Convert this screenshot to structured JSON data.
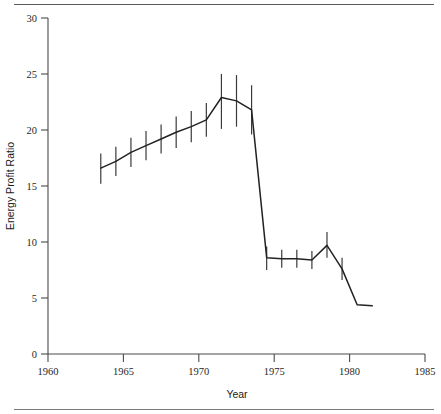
{
  "figure": {
    "has_top_rule": true,
    "has_bottom_rule": true,
    "background_color": "#ffffff",
    "line_color": "#222222",
    "axis_color": "#4a4a4a",
    "errorbar_color": "#3a3a3a"
  },
  "chart_data": {
    "type": "line",
    "title": "",
    "subtitle": "",
    "xlabel": "Year",
    "ylabel": "Energy Profit Ratio",
    "xlim": [
      1960,
      1985
    ],
    "ylim": [
      0,
      30
    ],
    "xticks": [
      1960,
      1965,
      1970,
      1975,
      1980,
      1985
    ],
    "xtick_labels": [
      "1960",
      "1965",
      "1970",
      "1975",
      "1980",
      "1985"
    ],
    "yticks": [
      0,
      5,
      10,
      15,
      20,
      25,
      30
    ],
    "ytick_labels": [
      "0",
      "5",
      "10",
      "15",
      "20",
      "25",
      "30"
    ],
    "grid": false,
    "legend": null,
    "legend_position": "none",
    "annotations": [],
    "series": [
      {
        "name": "Energy Profit Ratio",
        "x": [
          1963.5,
          1964.5,
          1965.5,
          1966.5,
          1967.5,
          1968.5,
          1969.5,
          1970.5,
          1971.5,
          1972.5,
          1973.5,
          1974.5,
          1975.5,
          1976.5,
          1977.5,
          1978.5,
          1979.5,
          1980.5,
          1981.5
        ],
        "values": [
          16.6,
          17.2,
          18.0,
          18.6,
          19.2,
          19.8,
          20.3,
          20.9,
          22.9,
          22.6,
          21.8,
          8.6,
          8.5,
          8.5,
          8.4,
          9.7,
          7.6,
          4.4,
          4.3
        ],
        "error_low": [
          15.2,
          15.9,
          16.7,
          17.3,
          17.9,
          18.4,
          18.9,
          19.4,
          20.1,
          20.3,
          19.6,
          7.5,
          7.7,
          7.7,
          7.6,
          8.6,
          6.6,
          null,
          null
        ],
        "error_high": [
          17.9,
          18.5,
          19.3,
          19.9,
          20.5,
          21.2,
          21.7,
          22.4,
          25.0,
          24.9,
          24.0,
          9.6,
          9.3,
          9.3,
          9.2,
          10.9,
          8.6,
          null,
          null
        ],
        "has_errorbars": true
      }
    ]
  }
}
